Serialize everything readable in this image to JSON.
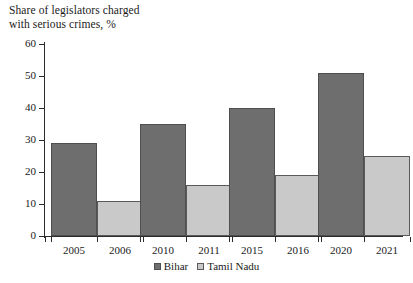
{
  "chart_data": {
    "type": "bar",
    "title": "Share of legislators charged\nwith serious crimes, %",
    "xlabel": "",
    "ylabel": "",
    "ylim": [
      0,
      60
    ],
    "yticks": [
      0,
      10,
      20,
      30,
      40,
      50,
      60
    ],
    "grid": false,
    "legend_position": "bottom",
    "categories": [
      "2005",
      "2006",
      "2010",
      "2011",
      "2015",
      "2016",
      "2020",
      "2021"
    ],
    "groups": [
      {
        "bihar_year": "2005",
        "tamil_year": "2006"
      },
      {
        "bihar_year": "2010",
        "tamil_year": "2011"
      },
      {
        "bihar_year": "2015",
        "tamil_year": "2016"
      },
      {
        "bihar_year": "2020",
        "tamil_year": "2021"
      }
    ],
    "series": [
      {
        "name": "Bihar",
        "color": "#6e6e6e",
        "x": [
          "2005",
          "2010",
          "2015",
          "2020"
        ],
        "values": [
          29,
          35,
          40,
          51
        ]
      },
      {
        "name": "Tamil Nadu",
        "color": "#c9c9c9",
        "x": [
          "2006",
          "2011",
          "2016",
          "2021"
        ],
        "values": [
          11,
          16,
          19,
          25
        ]
      }
    ],
    "bars": [
      {
        "label": "2005",
        "series": "Bihar",
        "value": 29
      },
      {
        "label": "2006",
        "series": "Tamil Nadu",
        "value": 11
      },
      {
        "label": "2010",
        "series": "Bihar",
        "value": 35
      },
      {
        "label": "2011",
        "series": "Tamil Nadu",
        "value": 16
      },
      {
        "label": "2015",
        "series": "Bihar",
        "value": 40
      },
      {
        "label": "2016",
        "series": "Tamil Nadu",
        "value": 19
      },
      {
        "label": "2020",
        "series": "Bihar",
        "value": 51
      },
      {
        "label": "2021",
        "series": "Tamil Nadu",
        "value": 25
      }
    ],
    "legend": [
      {
        "label": "Bihar",
        "color": "#6e6e6e"
      },
      {
        "label": "Tamil Nadu",
        "color": "#c9c9c9"
      }
    ]
  }
}
